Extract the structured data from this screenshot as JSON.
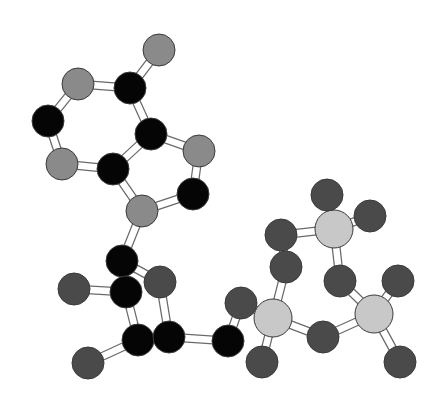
{
  "figure": {
    "title": "",
    "background": "#ffffff"
  },
  "palette": {
    "C": "#050505",
    "N": "#8a8a8a",
    "O": "#4a4a4a",
    "P": "#c8c8c8"
  },
  "legend_visible": false,
  "atoms": [
    {
      "id": 0,
      "el": "N",
      "x": 159,
      "y": 50,
      "r": 16
    },
    {
      "id": 1,
      "el": "C",
      "x": 130,
      "y": 88,
      "r": 16
    },
    {
      "id": 2,
      "el": "N",
      "x": 78,
      "y": 84,
      "r": 16
    },
    {
      "id": 3,
      "el": "C",
      "x": 48,
      "y": 121,
      "r": 16
    },
    {
      "id": 4,
      "el": "N",
      "x": 62,
      "y": 164,
      "r": 16
    },
    {
      "id": 5,
      "el": "C",
      "x": 113,
      "y": 169,
      "r": 16
    },
    {
      "id": 6,
      "el": "C",
      "x": 151,
      "y": 134,
      "r": 16
    },
    {
      "id": 7,
      "el": "N",
      "x": 199,
      "y": 151,
      "r": 16
    },
    {
      "id": 8,
      "el": "C",
      "x": 193,
      "y": 194,
      "r": 16
    },
    {
      "id": 9,
      "el": "N",
      "x": 142,
      "y": 211,
      "r": 16
    },
    {
      "id": 10,
      "el": "C",
      "x": 122,
      "y": 261,
      "r": 16
    },
    {
      "id": 11,
      "el": "C",
      "x": 126,
      "y": 292,
      "r": 16
    },
    {
      "id": 12,
      "el": "O",
      "x": 74,
      "y": 289,
      "r": 16
    },
    {
      "id": 13,
      "el": "O",
      "x": 160,
      "y": 282,
      "r": 16
    },
    {
      "id": 14,
      "el": "C",
      "x": 138,
      "y": 340,
      "r": 16
    },
    {
      "id": 15,
      "el": "C",
      "x": 169,
      "y": 337,
      "r": 16
    },
    {
      "id": 16,
      "el": "O",
      "x": 88,
      "y": 363,
      "r": 16
    },
    {
      "id": 17,
      "el": "C",
      "x": 228,
      "y": 341,
      "r": 16
    },
    {
      "id": 18,
      "el": "O",
      "x": 241,
      "y": 303,
      "r": 16
    },
    {
      "id": 19,
      "el": "P",
      "x": 273,
      "y": 318,
      "r": 19
    },
    {
      "id": 20,
      "el": "O",
      "x": 286,
      "y": 267,
      "r": 16
    },
    {
      "id": 21,
      "el": "O",
      "x": 262,
      "y": 362,
      "r": 16
    },
    {
      "id": 22,
      "el": "O",
      "x": 323,
      "y": 337,
      "r": 16
    },
    {
      "id": 23,
      "el": "P",
      "x": 374,
      "y": 314,
      "r": 19
    },
    {
      "id": 24,
      "el": "O",
      "x": 398,
      "y": 281,
      "r": 16
    },
    {
      "id": 25,
      "el": "O",
      "x": 400,
      "y": 362,
      "r": 16
    },
    {
      "id": 26,
      "el": "O",
      "x": 340,
      "y": 281,
      "r": 16
    },
    {
      "id": 27,
      "el": "P",
      "x": 334,
      "y": 229,
      "r": 19
    },
    {
      "id": 28,
      "el": "O",
      "x": 281,
      "y": 235,
      "r": 16
    },
    {
      "id": 29,
      "el": "O",
      "x": 327,
      "y": 195,
      "r": 16
    },
    {
      "id": 30,
      "el": "O",
      "x": 370,
      "y": 216,
      "r": 16
    }
  ],
  "bonds": [
    [
      0,
      1
    ],
    [
      1,
      2
    ],
    [
      2,
      3
    ],
    [
      3,
      4
    ],
    [
      4,
      5
    ],
    [
      5,
      6
    ],
    [
      6,
      1
    ],
    [
      6,
      7
    ],
    [
      7,
      8
    ],
    [
      8,
      9
    ],
    [
      9,
      5
    ],
    [
      9,
      10
    ],
    [
      10,
      11
    ],
    [
      10,
      13
    ],
    [
      11,
      12
    ],
    [
      11,
      14
    ],
    [
      14,
      15
    ],
    [
      15,
      13
    ],
    [
      14,
      16
    ],
    [
      15,
      17
    ],
    [
      17,
      18
    ],
    [
      18,
      19
    ],
    [
      19,
      20
    ],
    [
      19,
      21
    ],
    [
      19,
      22
    ],
    [
      22,
      23
    ],
    [
      23,
      24
    ],
    [
      23,
      25
    ],
    [
      23,
      26
    ],
    [
      26,
      27
    ],
    [
      27,
      28
    ],
    [
      27,
      29
    ],
    [
      27,
      30
    ],
    [
      20,
      28
    ]
  ]
}
